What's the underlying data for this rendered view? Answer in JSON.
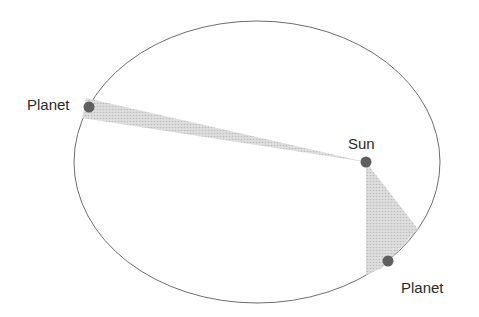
{
  "diagram": {
    "labels": {
      "planet_left": "Planet",
      "sun": "Sun",
      "planet_right": "Planet"
    },
    "colors": {
      "orbit": "#6e6e6e",
      "body": "#5f5f5f",
      "sweep": "#cfcfcf",
      "text": "#2a2a2a"
    },
    "orbit": {
      "cx": 257,
      "cy": 162,
      "rx": 183,
      "ry": 141
    },
    "sun": {
      "x": 366,
      "y": 162
    },
    "planets": [
      {
        "x": 89,
        "y": 107
      },
      {
        "x": 388,
        "y": 261
      }
    ]
  }
}
